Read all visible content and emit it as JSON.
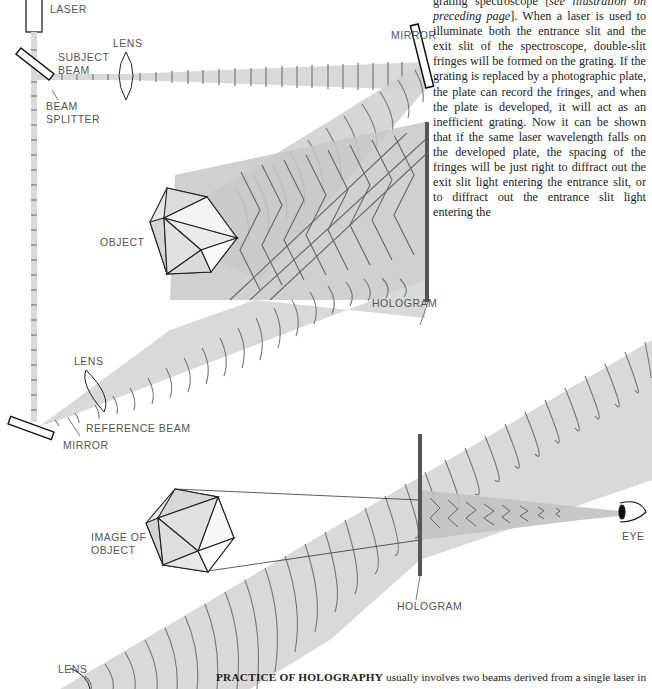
{
  "body_text": {
    "line1_start": "grating spectroscope [",
    "line1_italic": "see illustration on preceding page",
    "line1_end": "]. When a laser is used to illuminate both the entrance slit and the exit slit of the spectroscope, double-slit fringes will be formed on the grating. If the grating is replaced by a photographic plate, the plate can record the fringes, and when the plate is developed, it will act as an inefficient grating. Now it can be shown that if the same laser wavelength falls on the developed plate, the spacing of the fringes will be just right to diffract out the exit slit light entering the entrance slit, or to diffract out the entrance slit light entering the"
  },
  "diagram_top": {
    "labels": {
      "laser": "LASER",
      "subject_beam": "SUBJECT\nBEAM",
      "lens_subject": "LENS",
      "mirror_top": "MIRROR",
      "beam_splitter": "BEAM\nSPLITTER",
      "object": "OBJECT",
      "hologram": "HOLOGRAM",
      "lens_reference": "LENS",
      "reference_beam": "REFERENCE BEAM",
      "mirror_bottom": "MIRROR"
    }
  },
  "diagram_bottom": {
    "labels": {
      "image_of_object": "IMAGE OF\nOBJECT",
      "eye": "EYE",
      "hologram": "HOLOGRAM",
      "lens": "LENS"
    }
  },
  "caption": {
    "bold": "PRACTICE OF HOLOGRAPHY",
    "text": " usually involves two beams derived from a single laser in"
  },
  "colors": {
    "beam_fill": "#d9d9d9",
    "wavefront": "#777777",
    "hologram_plate": "#555555",
    "text": "#222222"
  }
}
